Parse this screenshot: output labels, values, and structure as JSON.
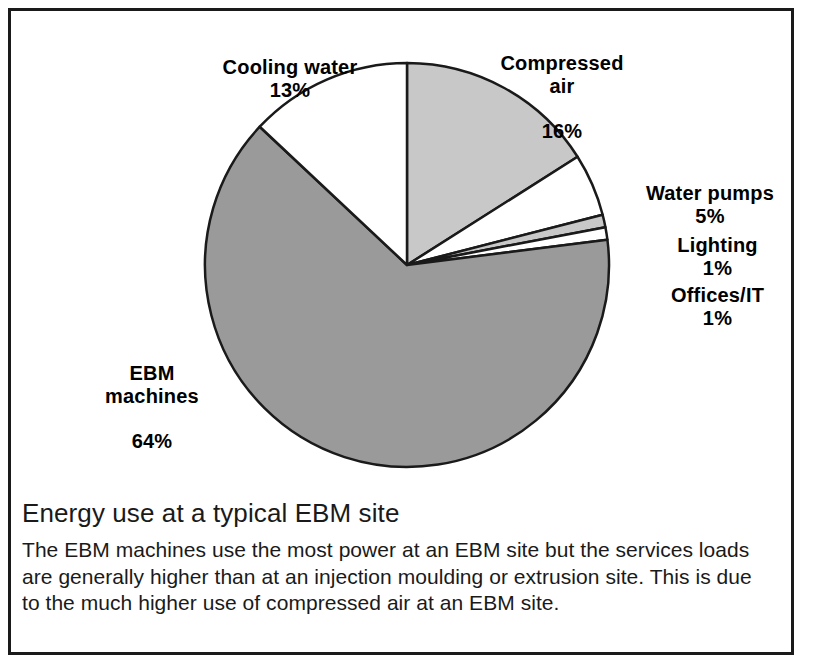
{
  "chart_data": {
    "type": "pie",
    "title": "Energy use at a typical EBM site",
    "description": "The EBM machines use the most power at an EBM site but the services loads are generally higher than at an injection moulding or extrusion site. This is due to the much higher use of compressed air at an EBM site.",
    "unit": "%",
    "start_angle_deg": 0,
    "direction": "clockwise",
    "legend": "none",
    "grid": false,
    "categories": [
      "Compressed air",
      "Water pumps",
      "Lighting",
      "Offices/IT",
      "EBM machines",
      "Cooling water"
    ],
    "values": [
      16,
      5,
      1,
      1,
      64,
      13
    ],
    "slices": [
      {
        "label": "Compressed air",
        "label_line1": "Compressed",
        "label_line2": "air",
        "value": 16,
        "percent_text": "16%",
        "color": "#c8c8c8"
      },
      {
        "label": "Water pumps",
        "label_line1": "Water pumps",
        "label_line2": "",
        "value": 5,
        "percent_text": "5%",
        "color": "#ffffff"
      },
      {
        "label": "Lighting",
        "label_line1": "Lighting",
        "label_line2": "",
        "value": 1,
        "percent_text": "1%",
        "color": "#c8c8c8"
      },
      {
        "label": "Offices/IT",
        "label_line1": "Offices/IT",
        "label_line2": "",
        "value": 1,
        "percent_text": "1%",
        "color": "#ffffff"
      },
      {
        "label": "EBM machines",
        "label_line1": "EBM",
        "label_line2": "machines",
        "value": 64,
        "percent_text": "64%",
        "color": "#9a9a9a"
      },
      {
        "label": "Cooling water",
        "label_line1": "Cooling water",
        "label_line2": "",
        "value": 13,
        "percent_text": "13%",
        "color": "#ffffff"
      }
    ],
    "colors": {
      "ebm_machines": "#9a9a9a",
      "compressed_air": "#c8c8c8",
      "lighting": "#c8c8c8",
      "white_slices": "#ffffff",
      "outline": "#1a1a1a",
      "frame": "#1a1a1a",
      "text": "#000000"
    }
  }
}
